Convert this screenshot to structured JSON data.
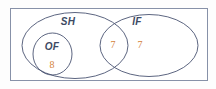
{
  "diagram": {
    "type": "venn",
    "title": "",
    "universe": {
      "name": "universal-set-rectangle",
      "label": ""
    },
    "sets": [
      {
        "id": "SH",
        "label": "SH",
        "label_x": 68,
        "label_y": 25
      },
      {
        "id": "IF",
        "label": "IF",
        "label_x": 137,
        "label_y": 25
      },
      {
        "id": "OF",
        "label": "OF",
        "label_x": 52,
        "label_y": 50
      }
    ],
    "values": [
      {
        "region": "OF",
        "value": "8",
        "x": 52,
        "y": 66
      },
      {
        "region": "SH-and-IF",
        "value": "7",
        "x": 113,
        "y": 47
      },
      {
        "region": "IF-only",
        "value": "7",
        "x": 140,
        "y": 47
      }
    ],
    "colors": {
      "stroke": "#4a5472",
      "rect_stroke": "#8791a8",
      "label_text": "#3d4a63",
      "value_text": "#d4823a",
      "background": "#ffffff"
    }
  }
}
